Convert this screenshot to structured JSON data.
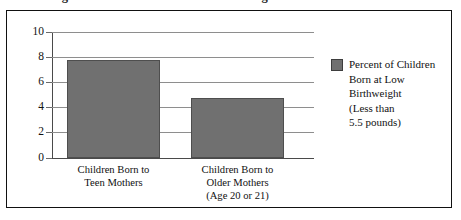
{
  "page": {
    "cut_off_title": "Percentage of Children Born at Low Birthweight"
  },
  "figure": {
    "legend": {
      "swatch_name": "legend-color-swatch",
      "text": "Percent of Children\nBorn at Low\nBirthweight\n(Less than\n5.5 pounds)"
    }
  },
  "chart_data": {
    "type": "bar",
    "title": "",
    "xlabel": "",
    "ylabel": "",
    "categories": [
      "Children Born to\nTeen Mothers",
      "Children Born to\nOlder Mothers\n(Age 20 or 21)"
    ],
    "values": [
      7.75,
      4.7
    ],
    "series": [
      {
        "name": "Percent of Children Born at Low Birthweight (Less than 5.5 pounds)",
        "values": [
          7.75,
          4.7
        ],
        "color": "#707070"
      }
    ],
    "ylim": [
      0,
      10
    ],
    "ytick_labels": [
      "10",
      "8",
      "6",
      "4",
      "2",
      "0"
    ],
    "ytick_values": [
      10,
      8,
      6,
      4,
      2,
      0
    ],
    "grid": true,
    "legend_position": "right"
  }
}
